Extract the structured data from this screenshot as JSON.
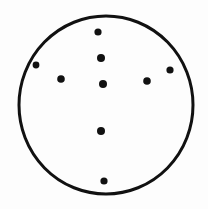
{
  "diagram": {
    "type": "dot-pattern-in-circle",
    "circle": {
      "cx": 106,
      "cy": 105,
      "rx": 87,
      "ry": 89,
      "stroke": "#111111",
      "stroke_width": 3
    },
    "dots": [
      {
        "x": 98,
        "y": 32,
        "r": 3.6
      },
      {
        "x": 101,
        "y": 58,
        "r": 4.0
      },
      {
        "x": 36,
        "y": 65,
        "r": 3.4
      },
      {
        "x": 61,
        "y": 79,
        "r": 3.8
      },
      {
        "x": 103,
        "y": 84,
        "r": 4.0
      },
      {
        "x": 147,
        "y": 81,
        "r": 3.8
      },
      {
        "x": 170,
        "y": 70,
        "r": 3.6
      },
      {
        "x": 101,
        "y": 131,
        "r": 4.0
      },
      {
        "x": 104,
        "y": 181,
        "r": 3.6
      }
    ],
    "dot_color": "#111111"
  }
}
